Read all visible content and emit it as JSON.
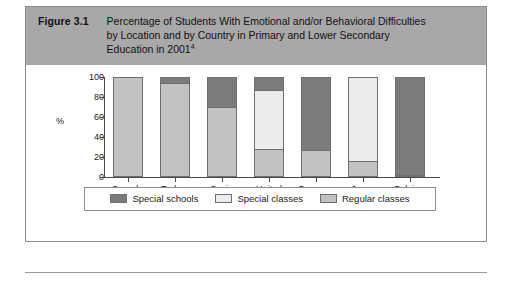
{
  "figure": {
    "number": "Figure 3.1",
    "title": "Percentage of Students With Emotional and/or Behavioral Difficulties by Location and by Country in Primary and Lower Secondary Education in 2001",
    "footnote_marker": "4"
  },
  "colors": {
    "special_schools": "#7b7b7b",
    "special_classes": "#ececec",
    "regular_classes": "#c2c2c2",
    "header_band": "#a8a8a8",
    "border": "#8e8e8e",
    "axis": "#4a4a4a"
  },
  "legend": {
    "items": [
      {
        "label": "Special schools",
        "color": "#7b7b7b"
      },
      {
        "label": "Special classes",
        "color": "#ececec"
      },
      {
        "label": "Regular classes",
        "color": "#c2c2c2"
      }
    ]
  },
  "chart_data": {
    "type": "bar",
    "stacked": true,
    "title": "Percentage of Students With Emotional and/or Behavioral Difficulties by Location and by Country in Primary and Lower Secondary Education in 2001",
    "xlabel": "",
    "ylabel": "%",
    "ylim": [
      0,
      100
    ],
    "yticks": [
      0,
      20,
      40,
      60,
      80,
      100
    ],
    "grid": false,
    "legend_position": "bottom",
    "categories": [
      "Canada\n(NB)",
      "Turkey",
      "Spain",
      "United\nStates",
      "Germany",
      "Japan",
      "Belgium\n(Fl.)"
    ],
    "category_labels": [
      {
        "line1": "Canada",
        "line2": "(NB)"
      },
      {
        "line1": "Turkey",
        "line2": ""
      },
      {
        "line1": "Spain",
        "line2": ""
      },
      {
        "line1": "United",
        "line2": "States"
      },
      {
        "line1": "Germany",
        "line2": ""
      },
      {
        "line1": "Japan",
        "line2": ""
      },
      {
        "line1": "Belgium",
        "line2": "(Fl.)"
      }
    ],
    "series": [
      {
        "name": "Special schools",
        "color": "#7b7b7b",
        "values": [
          0,
          6,
          30,
          13,
          74,
          0,
          99
        ]
      },
      {
        "name": "Special classes",
        "color": "#ececec",
        "values": [
          0,
          0,
          0,
          60,
          0,
          85,
          0
        ]
      },
      {
        "name": "Regular classes",
        "color": "#c2c2c2",
        "values": [
          100,
          94,
          70,
          27,
          26,
          15,
          1
        ]
      }
    ]
  }
}
